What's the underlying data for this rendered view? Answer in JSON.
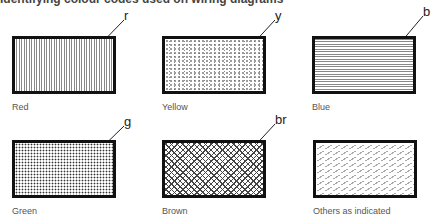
{
  "caption": "Identifying colour codes used on wiring diagrams",
  "swatches": [
    {
      "label": "Red",
      "code": "r",
      "pattern": "vertical-lines"
    },
    {
      "label": "Yellow",
      "code": "y",
      "pattern": "random-dots"
    },
    {
      "label": "Blue",
      "code": "b",
      "pattern": "horizontal-lines"
    },
    {
      "label": "Green",
      "code": "g",
      "pattern": "dense-dots"
    },
    {
      "label": "Brown",
      "code": "br",
      "pattern": "crosshatch"
    },
    {
      "label": "Others as indicated",
      "code": "",
      "pattern": "diagonal-dashes"
    }
  ]
}
